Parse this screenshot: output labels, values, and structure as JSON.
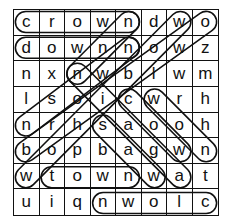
{
  "puzzle": {
    "rows": [
      [
        "c",
        "r",
        "o",
        "w",
        "n",
        "d",
        "w",
        "o"
      ],
      [
        "d",
        "o",
        "w",
        "n",
        "n",
        "o",
        "w",
        "z"
      ],
      [
        "n",
        "x",
        "n",
        "w",
        "b",
        "l",
        "w",
        "m"
      ],
      [
        "l",
        "s",
        "o",
        "i",
        "c",
        "w",
        "r",
        "h"
      ],
      [
        "n",
        "r",
        "h",
        "s",
        "a",
        "o",
        "o",
        "h"
      ],
      [
        "b",
        "o",
        "p",
        "b",
        "a",
        "g",
        "w",
        "n"
      ],
      [
        "w",
        "t",
        "o",
        "w",
        "n",
        "w",
        "a",
        "t"
      ],
      [
        "u",
        "i",
        "q",
        "n",
        "w",
        "o",
        "l",
        "c"
      ]
    ],
    "found_words": [
      {
        "from": [
          0,
          0
        ],
        "to": [
          0,
          4
        ]
      },
      {
        "from": [
          1,
          0
        ],
        "to": [
          1,
          4
        ]
      },
      {
        "from": [
          7,
          7
        ],
        "to": [
          7,
          3
        ]
      },
      {
        "from": [
          6,
          1
        ],
        "to": [
          6,
          4
        ]
      },
      {
        "from": [
          6,
          0
        ],
        "to": [
          0,
          6
        ]
      },
      {
        "from": [
          5,
          0
        ],
        "to": [
          0,
          7
        ]
      },
      {
        "from": [
          4,
          0
        ],
        "to": [
          1,
          4
        ]
      },
      {
        "from": [
          2,
          2
        ],
        "to": [
          6,
          6
        ]
      },
      {
        "from": [
          3,
          4
        ],
        "to": [
          5,
          6
        ]
      },
      {
        "from": [
          3,
          5
        ],
        "to": [
          5,
          7
        ]
      },
      {
        "from": [
          4,
          3
        ],
        "to": [
          6,
          5
        ]
      },
      {
        "from": [
          2,
          2
        ],
        "to": [
          0,
          4
        ]
      }
    ]
  }
}
